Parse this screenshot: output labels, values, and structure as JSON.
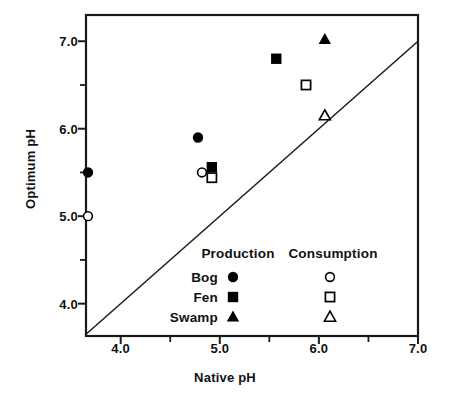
{
  "chart_data": {
    "type": "scatter",
    "title": "",
    "xlabel": "Native pH",
    "ylabel": "Optimum pH",
    "xlim": [
      3.65,
      7.0
    ],
    "ylim": [
      3.63,
      7.3
    ],
    "grid": false,
    "xticks": [
      4.0,
      5.0,
      6.0,
      7.0
    ],
    "xtick_labels": [
      "4.0",
      "5.0",
      "6.0",
      "7.0"
    ],
    "xminor_ticks": [
      4.5,
      5.5,
      6.5
    ],
    "yticks": [
      4.0,
      5.0,
      6.0,
      7.0
    ],
    "ytick_labels": [
      "4.0",
      "5.0",
      "6.0",
      "7.0"
    ],
    "yminor_ticks": [
      4.5,
      5.5,
      6.5
    ],
    "reference_line": {
      "description": "1:1 line",
      "x": [
        3.65,
        7.0
      ],
      "y": [
        3.65,
        7.0
      ]
    },
    "legend": {
      "position": "lower-center-right",
      "column_headers": [
        "Production",
        "Consumption"
      ],
      "row_labels": [
        "Bog",
        "Fen",
        "Swamp"
      ],
      "markers": {
        "Bog": {
          "production": "filled-circle",
          "consumption": "open-circle"
        },
        "Fen": {
          "production": "filled-square",
          "consumption": "open-square"
        },
        "Swamp": {
          "production": "filled-triangle",
          "consumption": "open-triangle"
        }
      }
    },
    "series": [
      {
        "name": "Bog Production",
        "habitat": "Bog",
        "measure": "Production",
        "marker": "filled-circle",
        "points": [
          {
            "x": 3.67,
            "y": 5.5
          },
          {
            "x": 4.78,
            "y": 5.9
          }
        ]
      },
      {
        "name": "Bog Consumption",
        "habitat": "Bog",
        "measure": "Consumption",
        "marker": "open-circle",
        "points": [
          {
            "x": 3.67,
            "y": 5.0
          },
          {
            "x": 4.82,
            "y": 5.5
          }
        ]
      },
      {
        "name": "Fen Production",
        "habitat": "Fen",
        "measure": "Production",
        "marker": "filled-square",
        "points": [
          {
            "x": 4.92,
            "y": 5.56
          },
          {
            "x": 5.57,
            "y": 6.8
          }
        ]
      },
      {
        "name": "Fen Consumption",
        "habitat": "Fen",
        "measure": "Consumption",
        "marker": "open-square",
        "points": [
          {
            "x": 4.92,
            "y": 5.44
          },
          {
            "x": 5.87,
            "y": 6.5
          }
        ]
      },
      {
        "name": "Swamp Production",
        "habitat": "Swamp",
        "measure": "Production",
        "marker": "filled-triangle",
        "points": [
          {
            "x": 6.06,
            "y": 7.02
          }
        ]
      },
      {
        "name": "Swamp Consumption",
        "habitat": "Swamp",
        "measure": "Consumption",
        "marker": "open-triangle",
        "points": [
          {
            "x": 6.06,
            "y": 6.15
          }
        ]
      }
    ],
    "colors": {
      "marker": "#000000",
      "axis": "#1a1a1a",
      "line": "#1a1a1a",
      "background": "#ffffff"
    }
  }
}
